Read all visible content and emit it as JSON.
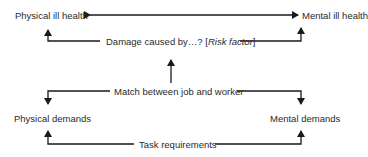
{
  "diagram": {
    "nodes": {
      "physical_ill_health": "Physical ill health",
      "mental_ill_health": "Mental ill health",
      "damage_prefix": "Damage caused by…? [",
      "damage_risk": "Risk factor",
      "damage_suffix": "]",
      "match": "Match between job and worker",
      "physical_demands": "Physical demands",
      "mental_demands": "Mental demands",
      "task_requirements": "Task requirements"
    },
    "edges": [
      {
        "from": "physical_ill_health",
        "to": "mental_ill_health",
        "type": "bidirectional"
      },
      {
        "from": "damage",
        "to": "physical_ill_health",
        "type": "arrow"
      },
      {
        "from": "damage",
        "to": "mental_ill_health",
        "type": "arrow"
      },
      {
        "from": "match",
        "to": "damage",
        "type": "arrow"
      },
      {
        "from": "match",
        "to": "physical_demands",
        "type": "arrow"
      },
      {
        "from": "match",
        "to": "mental_demands",
        "type": "arrow"
      },
      {
        "from": "task_requirements",
        "to": "physical_demands",
        "type": "arrow"
      },
      {
        "from": "task_requirements",
        "to": "mental_demands",
        "type": "arrow"
      }
    ],
    "colors": {
      "line": "#1a1a1a",
      "text": "#2a2a2a",
      "background": "#ffffff"
    }
  }
}
